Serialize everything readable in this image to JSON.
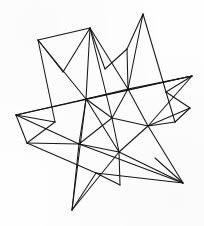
{
  "figure": {
    "title": "Small Stellated Dodecahedron",
    "style": "hand-drawn ink line engraving",
    "medium": "line art on white paper",
    "canvas": {
      "width": 204,
      "height": 226
    },
    "background_color": "#fefefe",
    "line_color": "#161616",
    "line_width": 1.05,
    "fill": "none",
    "spike_count": 12,
    "vertex_count": 32,
    "points": {
      "spike_top_left": {
        "x": 90,
        "y": 28
      },
      "spike_top_right": {
        "x": 143,
        "y": 14
      },
      "spike_upper_left": {
        "x": 38,
        "y": 40
      },
      "spike_right": {
        "x": 192,
        "y": 76
      },
      "spike_right_lower": {
        "x": 190,
        "y": 108
      },
      "spike_left": {
        "x": 16,
        "y": 115
      },
      "spike_left_lower": {
        "x": 27,
        "y": 143
      },
      "spike_bottom_left": {
        "x": 72,
        "y": 210
      },
      "spike_bottom_center": {
        "x": 120,
        "y": 185
      },
      "spike_bottom_right": {
        "x": 183,
        "y": 183
      },
      "spike_mid_right": {
        "x": 175,
        "y": 122
      },
      "spike_mid_upper": {
        "x": 127,
        "y": 49
      },
      "core_a": {
        "x": 86,
        "y": 99
      },
      "core_b": {
        "x": 128,
        "y": 89
      },
      "core_c": {
        "x": 148,
        "y": 126
      },
      "core_d": {
        "x": 119,
        "y": 152
      },
      "core_e": {
        "x": 79,
        "y": 144
      },
      "core_f": {
        "x": 105,
        "y": 69
      },
      "core_g": {
        "x": 63,
        "y": 72
      },
      "core_h": {
        "x": 166,
        "y": 92
      },
      "core_i": {
        "x": 155,
        "y": 158
      },
      "core_j": {
        "x": 96,
        "y": 173
      },
      "core_k": {
        "x": 55,
        "y": 122
      },
      "core_l": {
        "x": 112,
        "y": 118
      }
    },
    "edges": [
      [
        "spike_upper_left",
        "spike_top_left"
      ],
      [
        "spike_upper_left",
        "core_g"
      ],
      [
        "spike_upper_left",
        "core_k"
      ],
      [
        "spike_upper_left",
        "core_a"
      ],
      [
        "spike_top_left",
        "core_g"
      ],
      [
        "spike_top_left",
        "core_f"
      ],
      [
        "spike_top_left",
        "core_a"
      ],
      [
        "spike_top_left",
        "core_b"
      ],
      [
        "spike_top_left",
        "core_l"
      ],
      [
        "spike_mid_upper",
        "core_f"
      ],
      [
        "spike_mid_upper",
        "core_b"
      ],
      [
        "spike_mid_upper",
        "spike_top_right"
      ],
      [
        "spike_top_right",
        "core_b"
      ],
      [
        "spike_top_right",
        "core_h"
      ],
      [
        "spike_right",
        "core_h"
      ],
      [
        "spike_right",
        "core_b"
      ],
      [
        "spike_right",
        "core_a"
      ],
      [
        "spike_right",
        "spike_left"
      ],
      [
        "spike_right",
        "core_c"
      ],
      [
        "spike_right_lower",
        "core_h"
      ],
      [
        "spike_right_lower",
        "core_c"
      ],
      [
        "spike_right_lower",
        "spike_mid_right"
      ],
      [
        "spike_mid_right",
        "core_c"
      ],
      [
        "spike_mid_right",
        "core_h"
      ],
      [
        "spike_left",
        "core_k"
      ],
      [
        "spike_left",
        "core_a"
      ],
      [
        "spike_left",
        "core_e"
      ],
      [
        "spike_left",
        "spike_left_lower"
      ],
      [
        "spike_left_lower",
        "core_k"
      ],
      [
        "spike_left_lower",
        "core_e"
      ],
      [
        "spike_left_lower",
        "core_j"
      ],
      [
        "spike_bottom_left",
        "core_e"
      ],
      [
        "spike_bottom_left",
        "core_j"
      ],
      [
        "spike_bottom_left",
        "core_a"
      ],
      [
        "spike_bottom_left",
        "core_d"
      ],
      [
        "spike_bottom_center",
        "core_d"
      ],
      [
        "spike_bottom_center",
        "core_j"
      ],
      [
        "spike_bottom_right",
        "core_i"
      ],
      [
        "spike_bottom_right",
        "core_d"
      ],
      [
        "spike_bottom_right",
        "core_c"
      ],
      [
        "spike_bottom_right",
        "core_j"
      ],
      [
        "spike_bottom_right",
        "core_e"
      ],
      [
        "core_a",
        "core_b"
      ],
      [
        "core_a",
        "core_l"
      ],
      [
        "core_a",
        "core_e"
      ],
      [
        "core_a",
        "core_d"
      ],
      [
        "core_b",
        "core_c"
      ],
      [
        "core_b",
        "core_l"
      ],
      [
        "core_c",
        "core_d"
      ],
      [
        "core_c",
        "core_l"
      ],
      [
        "core_d",
        "core_e"
      ],
      [
        "core_d",
        "core_l"
      ],
      [
        "core_e",
        "core_l"
      ]
    ]
  }
}
